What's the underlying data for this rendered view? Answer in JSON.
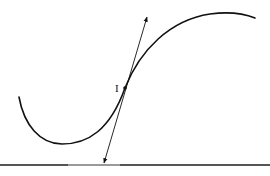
{
  "diagram": {
    "title": "",
    "point_label": "I",
    "elements": {
      "curve": "S-shaped curve with local minimum on left and maximum on right",
      "tangent": "tangent line with arrowheads at both ends through inflection point I",
      "point": "inflection point I"
    },
    "colors": {
      "stroke": "#111111",
      "background": "#ffffff",
      "rule": "#555555"
    }
  }
}
